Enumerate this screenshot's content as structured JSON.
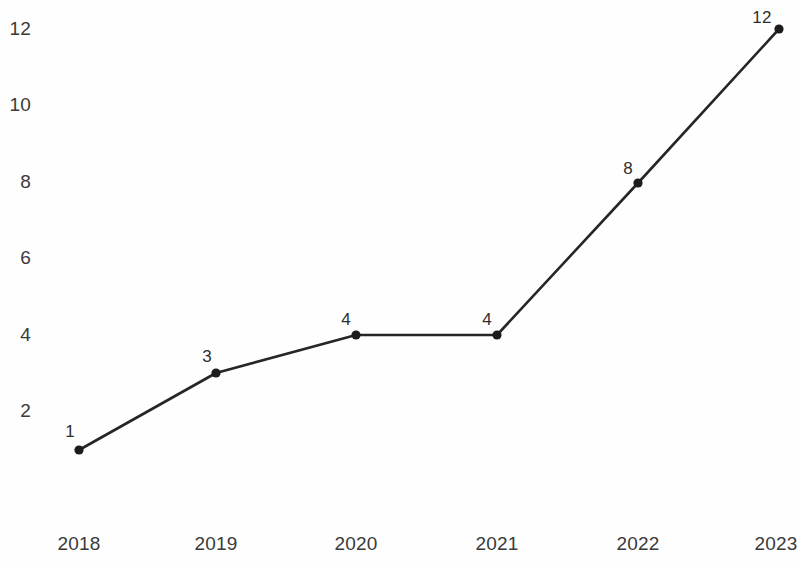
{
  "chart_data": {
    "type": "line",
    "title": "",
    "subtitle": "",
    "xlabel": "",
    "ylabel": "",
    "categories": [
      "2018",
      "2019",
      "2020",
      "2021",
      "2022",
      "2023"
    ],
    "values": [
      1,
      3,
      4,
      4,
      8,
      12
    ],
    "point_labels": [
      "1",
      "3",
      "4",
      "4",
      "8",
      "12"
    ],
    "y_ticks": [
      "12",
      "10",
      "8",
      "6",
      "4",
      "2"
    ],
    "y_tick_values": [
      12,
      10,
      8,
      6,
      4,
      2
    ],
    "ylim": [
      0,
      12.8
    ],
    "xlim": [
      0,
      5
    ],
    "grid": false,
    "legend": null,
    "legend_position": "none",
    "series": [
      {
        "name": "",
        "values": [
          1,
          3,
          4,
          4,
          8,
          12
        ]
      }
    ],
    "colors": {
      "line": "#262626",
      "marker": "#1c1c1c",
      "tick_text": "#3a3a3a",
      "label_text": "#2e2e2e",
      "background": "#fefefe"
    },
    "geometry": {
      "point_px": [
        {
          "x": 79,
          "y": 450
        },
        {
          "x": 216,
          "y": 373
        },
        {
          "x": 356,
          "y": 335
        },
        {
          "x": 497,
          "y": 335
        },
        {
          "x": 638,
          "y": 183
        },
        {
          "x": 779,
          "y": 29
        }
      ],
      "point_label_px": [
        {
          "x": 70,
          "y": 432
        },
        {
          "x": 207,
          "y": 357
        },
        {
          "x": 346,
          "y": 320
        },
        {
          "x": 487,
          "y": 320
        },
        {
          "x": 628,
          "y": 169
        },
        {
          "x": 762,
          "y": 18
        }
      ],
      "y_tick_px": [
        29,
        105,
        182,
        258,
        335,
        411
      ],
      "y_tick_right_x": 31,
      "x_tick_px": [
        79,
        216,
        356,
        497,
        638,
        776
      ],
      "x_tick_baseline_y": 533,
      "marker_radius": 4.6,
      "line_width": 2.6
    }
  }
}
